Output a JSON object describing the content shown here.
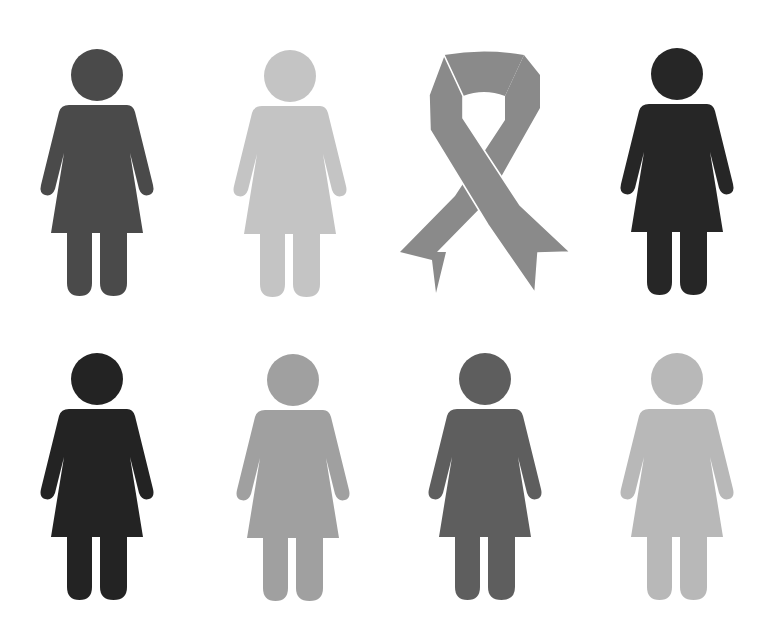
{
  "title": "Women figures with awareness ribbon",
  "background": "#ffffff",
  "grid": {
    "rows": 2,
    "cols": 4
  },
  "items": [
    {
      "type": "woman",
      "row": 0,
      "col": 0,
      "color": "#4a4a4a",
      "cx": 97,
      "cy": 75,
      "label": "woman figure dark gray"
    },
    {
      "type": "woman",
      "row": 0,
      "col": 1,
      "color": "#c4c4c4",
      "cx": 290,
      "cy": 76,
      "label": "woman figure light gray"
    },
    {
      "type": "ribbon",
      "row": 0,
      "col": 2,
      "color": "#8a8a8a",
      "label": "awareness ribbon"
    },
    {
      "type": "woman",
      "row": 0,
      "col": 3,
      "color": "#262626",
      "cx": 677,
      "cy": 74,
      "label": "woman figure black"
    },
    {
      "type": "woman",
      "row": 1,
      "col": 0,
      "color": "#232323",
      "cx": 97,
      "cy": 379,
      "label": "woman figure black"
    },
    {
      "type": "woman",
      "row": 1,
      "col": 1,
      "color": "#a0a0a0",
      "cx": 293,
      "cy": 380,
      "label": "woman figure medium gray"
    },
    {
      "type": "woman",
      "row": 1,
      "col": 2,
      "color": "#5e5e5e",
      "cx": 485,
      "cy": 379,
      "label": "woman figure dark gray"
    },
    {
      "type": "woman",
      "row": 1,
      "col": 3,
      "color": "#b8b8b8",
      "cx": 677,
      "cy": 379,
      "label": "woman figure light gray"
    }
  ]
}
